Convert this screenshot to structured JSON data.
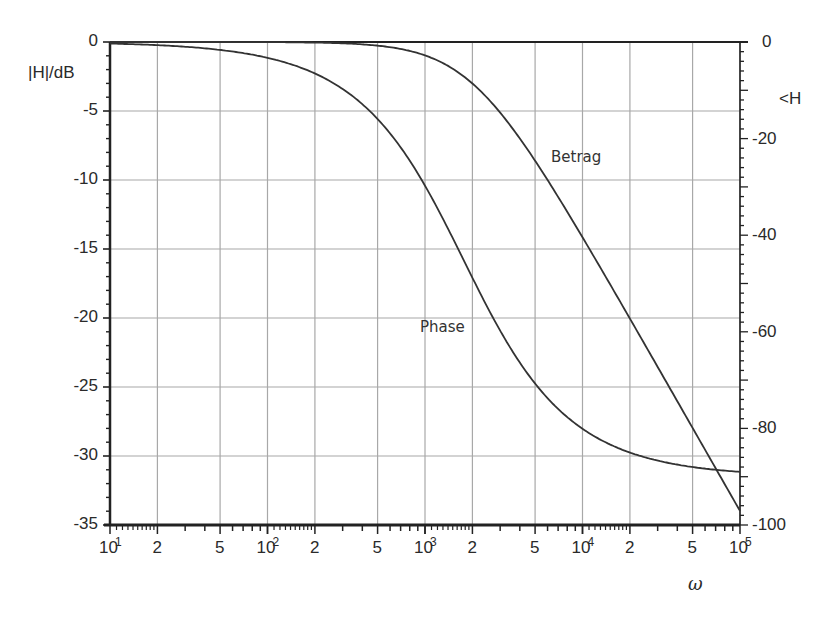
{
  "chart_data": {
    "type": "line",
    "title": "",
    "plot_kind": "Bode plot (magnitude and phase), semi-log x-axis",
    "xlabel": "ω",
    "xscale": "log",
    "xlim": [
      10,
      100000
    ],
    "x_ticks": [
      {
        "value": 10,
        "base": "10",
        "exp": "1"
      },
      {
        "value": 20,
        "label": "2"
      },
      {
        "value": 50,
        "label": "5"
      },
      {
        "value": 100,
        "base": "10",
        "exp": "2"
      },
      {
        "value": 200,
        "label": "2"
      },
      {
        "value": 500,
        "label": "5"
      },
      {
        "value": 1000,
        "base": "10",
        "exp": "3"
      },
      {
        "value": 2000,
        "label": "2"
      },
      {
        "value": 5000,
        "label": "5"
      },
      {
        "value": 10000,
        "base": "10",
        "exp": "4"
      },
      {
        "value": 20000,
        "label": "2"
      },
      {
        "value": 50000,
        "label": "5"
      },
      {
        "value": 100000,
        "base": "10",
        "exp": "5"
      }
    ],
    "ylabel_left": "|H|/dB",
    "ylim_left": [
      -35,
      0
    ],
    "y_ticks_left": [
      "0",
      "-5",
      "-10",
      "-15",
      "-20",
      "-25",
      "-30",
      "-35"
    ],
    "ylabel_right": "<H",
    "ylim_right": [
      -100,
      0
    ],
    "y_ticks_right": [
      "0",
      "-20",
      "-40",
      "-60",
      "-80",
      "-100"
    ],
    "grid": true,
    "legend": "inline curve labels",
    "series": [
      {
        "name": "Betrag",
        "axis": "left",
        "unit": "dB",
        "x": [
          10,
          20,
          50,
          100,
          200,
          500,
          1000,
          2000,
          3000,
          5000,
          7000,
          10000,
          20000,
          50000,
          70000,
          100000
        ],
        "values": [
          0.0,
          0.0,
          0.0,
          -0.01,
          -0.04,
          -0.26,
          -0.97,
          -3.01,
          -5.12,
          -8.6,
          -11.1,
          -14.15,
          -20.04,
          -27.96,
          -30.88,
          -33.98
        ]
      },
      {
        "name": "Phase",
        "axis": "right",
        "unit": "degree",
        "x": [
          10,
          20,
          50,
          100,
          200,
          500,
          1000,
          1750,
          2000,
          3000,
          5000,
          10000,
          20000,
          50000,
          100000
        ],
        "values": [
          -0.3,
          -0.7,
          -1.6,
          -3.3,
          -6.5,
          -15.9,
          -29.7,
          -45.0,
          -48.8,
          -59.7,
          -70.7,
          -80.1,
          -85.0,
          -88.0,
          -89.0
        ]
      }
    ],
    "annotations": [
      {
        "text": "Betrag",
        "near_x": 9000,
        "near_y_dB": -8.5
      },
      {
        "text": "Phase",
        "near_x": 1000,
        "near_y_dB": -20.5
      }
    ]
  },
  "axes": {
    "left_title": "|H|/dB",
    "right_title": "<H",
    "x_title": "ω"
  },
  "labels": {
    "betrag": "Betrag",
    "phase": "Phase"
  }
}
